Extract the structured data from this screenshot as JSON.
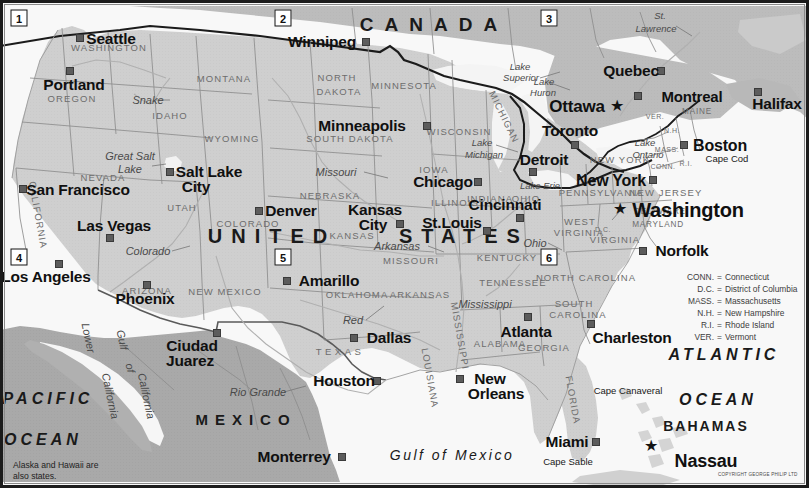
{
  "map": {
    "title": "United States reference map",
    "colors": {
      "us_land": "#cfcfcf",
      "canada_land": "#bcbcbc",
      "mexico_land": "#a9a9a9",
      "water": "#f7f7f7",
      "lake": "#f2f2f2",
      "border_line": "#1d1d1d",
      "state_line": "#8d8d8d",
      "river": "#b6b6b6",
      "frame": "#1b1b1b",
      "city_marker": "#5c5c5c",
      "text_dark": "#101010",
      "text_state": "#6d6d6d"
    },
    "note": "Alaska and Hawaii are\nalso states.",
    "note_line1": "Alaska and Hawaii are",
    "note_line2": "also states.",
    "copyright": "COPYRIGHT GEORGE PHILIP LTD"
  },
  "countries": [
    {
      "name": "CANADA",
      "x": 434,
      "y": 24
    },
    {
      "name": "UNITED  STATES",
      "x": 372,
      "y": 236
    },
    {
      "name": "MEXICO",
      "x": 246,
      "y": 419
    }
  ],
  "country_parts": [
    {
      "name": "UNITED",
      "x": 272,
      "y": 236
    },
    {
      "name": "STATES",
      "x": 464,
      "y": 236
    }
  ],
  "cities": [
    {
      "name": "Seattle",
      "label_x": 111,
      "label_y": 39,
      "dot_x": 80,
      "dot_y": 38,
      "size": "big",
      "capital": false
    },
    {
      "name": "Portland",
      "label_x": 74,
      "label_y": 84,
      "dot_x": 70,
      "dot_y": 71,
      "size": "big",
      "capital": false
    },
    {
      "name": "San Francisco",
      "label_x": 76,
      "label_y": 190,
      "dot_x": 23,
      "dot_y": 189,
      "size": "big",
      "capital": false
    },
    {
      "name": "Los Angeles",
      "label_x": 46,
      "label_y": 277,
      "dot_x": 59,
      "dot_y": 264,
      "size": "big",
      "capital": false
    },
    {
      "name": "Las Vegas",
      "label_x": 114,
      "label_y": 226,
      "dot_x": 110,
      "dot_y": 238,
      "size": "big",
      "capital": false
    },
    {
      "name": "Salt Lake",
      "label_x": 209,
      "label_y": 172,
      "dot_x": 170,
      "dot_y": 172,
      "size": "big",
      "capital": false
    },
    {
      "name": "City",
      "label_x": 196,
      "label_y": 186,
      "dot_x": null,
      "dot_y": null,
      "size": "big",
      "capital": false
    },
    {
      "name": "Phoenix",
      "label_x": 145,
      "label_y": 298,
      "dot_x": 147,
      "dot_y": 285,
      "size": "big",
      "capital": false
    },
    {
      "name": "Denver",
      "label_x": 291,
      "label_y": 211,
      "dot_x": 259,
      "dot_y": 211,
      "size": "big",
      "capital": false
    },
    {
      "name": "Amarillo",
      "label_x": 329,
      "label_y": 281,
      "dot_x": 287,
      "dot_y": 281,
      "size": "big",
      "capital": false
    },
    {
      "name": "Ciudad",
      "label_x": 192,
      "label_y": 345,
      "dot_x": 217,
      "dot_y": 333,
      "size": "big",
      "capital": false
    },
    {
      "name": "Juarez",
      "label_x": 190,
      "label_y": 360,
      "dot_x": null,
      "dot_y": null,
      "size": "big",
      "capital": false
    },
    {
      "name": "Dallas",
      "label_x": 389,
      "label_y": 337,
      "dot_x": 354,
      "dot_y": 338,
      "size": "big",
      "capital": false
    },
    {
      "name": "Houston",
      "label_x": 345,
      "label_y": 381,
      "dot_x": 377,
      "dot_y": 381,
      "size": "big",
      "capital": false
    },
    {
      "name": "Monterrey",
      "label_x": 293,
      "label_y": 457,
      "dot_x": 342,
      "dot_y": 457,
      "size": "big",
      "capital": false
    },
    {
      "name": "Winnipeg",
      "label_x": 322,
      "label_y": 42,
      "dot_x": 366,
      "dot_y": 42,
      "size": "big",
      "capital": false
    },
    {
      "name": "Minneapolis",
      "label_x": 362,
      "label_y": 125,
      "dot_x": 427,
      "dot_y": 126,
      "size": "big",
      "capital": false
    },
    {
      "name": "Kansas",
      "label_x": 375,
      "label_y": 210,
      "dot_x": null,
      "dot_y": null,
      "size": "big",
      "capital": false
    },
    {
      "name": "City",
      "label_x": 373,
      "label_y": 224,
      "dot_x": 400,
      "dot_y": 224,
      "size": "big",
      "capital": false
    },
    {
      "name": "Chicago",
      "label_x": 443,
      "label_y": 182,
      "dot_x": 478,
      "dot_y": 182,
      "size": "big",
      "capital": false
    },
    {
      "name": "St.Louis",
      "label_x": 452,
      "label_y": 223,
      "dot_x": 487,
      "dot_y": 231,
      "size": "big",
      "capital": false
    },
    {
      "name": "Detroit",
      "label_x": 544,
      "label_y": 160,
      "dot_x": 533,
      "dot_y": 172,
      "size": "big",
      "capital": false
    },
    {
      "name": "Cincinnati",
      "label_x": 505,
      "label_y": 205,
      "dot_x": 520,
      "dot_y": 218,
      "size": "big",
      "capital": false
    },
    {
      "name": "New Orleans",
      "label_x": 491,
      "label_y": 379,
      "dot_x": 460,
      "dot_y": 379,
      "size": "big",
      "capital": false
    },
    {
      "name": "New",
      "label_x": 488,
      "label_y": 379,
      "dot_x": null,
      "dot_y": null,
      "size": "big",
      "capital": false
    },
    {
      "name": "Orleans",
      "label_x": 495,
      "label_y": 393,
      "dot_x": null,
      "dot_y": null,
      "size": "big",
      "capital": false
    },
    {
      "name": "Atlanta",
      "label_x": 526,
      "label_y": 331,
      "dot_x": 528,
      "dot_y": 317,
      "size": "big",
      "capital": false
    },
    {
      "name": "Charleston",
      "label_x": 630,
      "label_y": 337,
      "dot_x": 591,
      "dot_y": 324,
      "size": "big",
      "capital": false
    },
    {
      "name": "Miami",
      "label_x": 566,
      "label_y": 441,
      "dot_x": 596,
      "dot_y": 442,
      "size": "big",
      "capital": false
    },
    {
      "name": "Norfolk",
      "label_x": 680,
      "label_y": 251,
      "dot_x": 643,
      "dot_y": 251,
      "size": "big",
      "capital": false
    },
    {
      "name": "Washington",
      "label_x": 684,
      "label_y": 210,
      "dot_x": null,
      "dot_y": null,
      "size": "cap",
      "capital": true,
      "star_x": 620,
      "star_y": 209
    },
    {
      "name": "New York",
      "label_x": 611,
      "label_y": 181,
      "dot_x": 653,
      "dot_y": 180,
      "size": "big",
      "capital": false
    },
    {
      "name": "Boston",
      "label_x": 718,
      "label_y": 146,
      "dot_x": 684,
      "dot_y": 145,
      "size": "big",
      "capital": false
    },
    {
      "name": "Toronto",
      "label_x": 570,
      "label_y": 131,
      "dot_x": 575,
      "dot_y": 145,
      "size": "big",
      "capital": false
    },
    {
      "name": "Ottawa",
      "label_x": 577,
      "label_y": 106,
      "dot_x": null,
      "dot_y": null,
      "size": "cap",
      "capital": true,
      "star_x": 617,
      "star_y": 106
    },
    {
      "name": "Montreal",
      "label_x": 692,
      "label_y": 95,
      "dot_x": 638,
      "dot_y": 96,
      "size": "big",
      "capital": false
    },
    {
      "name": "Quebec",
      "label_x": 631,
      "label_y": 71,
      "dot_x": 661,
      "dot_y": 71,
      "size": "big",
      "capital": false
    },
    {
      "name": "Halifax",
      "label_x": 777,
      "label_y": 104,
      "dot_x": 758,
      "dot_y": 92,
      "size": "big",
      "capital": false
    },
    {
      "name": "Nassau",
      "label_x": 704,
      "label_y": 460,
      "dot_x": null,
      "dot_y": null,
      "size": "cap",
      "capital": true,
      "star_x": 651,
      "star_y": 446
    }
  ],
  "states": [
    {
      "name": "WASHINGTON",
      "x": 109,
      "y": 48,
      "cls": "state"
    },
    {
      "name": "OREGON",
      "x": 72,
      "y": 99,
      "cls": "state"
    },
    {
      "name": "CALIFORNIA",
      "x": 38,
      "y": 215,
      "cls": "state rot",
      "rot": 80
    },
    {
      "name": "NEVADA",
      "x": 103,
      "y": 178,
      "cls": "state"
    },
    {
      "name": "IDAHO",
      "x": 170,
      "y": 116,
      "cls": "state"
    },
    {
      "name": "MONTANA",
      "x": 224,
      "y": 79,
      "cls": "state"
    },
    {
      "name": "WYOMING",
      "x": 232,
      "y": 139,
      "cls": "state"
    },
    {
      "name": "UTAH",
      "x": 182,
      "y": 208,
      "cls": "state"
    },
    {
      "name": "ARIZONA",
      "x": 147,
      "y": 281,
      "cls": "state"
    },
    {
      "name": "NEW MEXICO",
      "x": 225,
      "y": 292,
      "cls": "state"
    },
    {
      "name": "COLORADO",
      "x": 248,
      "y": 224,
      "cls": "state"
    },
    {
      "name": "NORTH",
      "x": 337,
      "y": 78,
      "cls": "state"
    },
    {
      "name": "DAKOTA",
      "x": 339,
      "y": 92,
      "cls": "state"
    },
    {
      "name": "SOUTH DAKOTA",
      "x": 350,
      "y": 139,
      "cls": "state"
    },
    {
      "name": "NEBRASKA",
      "x": 330,
      "y": 196,
      "cls": "state"
    },
    {
      "name": "KANSAS",
      "x": 352,
      "y": 236,
      "cls": "state"
    },
    {
      "name": "OKLAHOMA",
      "x": 357,
      "y": 295,
      "cls": "state"
    },
    {
      "name": "TEXAS",
      "x": 340,
      "y": 352,
      "cls": "state"
    },
    {
      "name": "MINNESOTA",
      "x": 404,
      "y": 86,
      "cls": "state"
    },
    {
      "name": "IOWA",
      "x": 434,
      "y": 170,
      "cls": "state"
    },
    {
      "name": "MISSOURI",
      "x": 411,
      "y": 261,
      "cls": "state"
    },
    {
      "name": "ARKANSAS",
      "x": 420,
      "y": 295,
      "cls": "state"
    },
    {
      "name": "LOUISIANA",
      "x": 430,
      "y": 378,
      "cls": "state rot",
      "rot": 80
    },
    {
      "name": "WISCONSIN",
      "x": 459,
      "y": 132,
      "cls": "state"
    },
    {
      "name": "ILLINOIS",
      "x": 455,
      "y": 203,
      "cls": "state"
    },
    {
      "name": "INDIANA",
      "x": 490,
      "y": 199,
      "cls": "state"
    },
    {
      "name": "MICHIGAN",
      "x": 504,
      "y": 117,
      "cls": "state rot",
      "rot": 64
    },
    {
      "name": "OHIO",
      "x": 526,
      "y": 199,
      "cls": "state"
    },
    {
      "name": "KENTUCKY",
      "x": 507,
      "y": 258,
      "cls": "state"
    },
    {
      "name": "TENNESSEE",
      "x": 513,
      "y": 283,
      "cls": "state"
    },
    {
      "name": "MISSISSIPPI",
      "x": 460,
      "y": 336,
      "cls": "state rot",
      "rot": 80
    },
    {
      "name": "ALABAMA",
      "x": 500,
      "y": 344,
      "cls": "state"
    },
    {
      "name": "GEORGIA",
      "x": 544,
      "y": 348,
      "cls": "state"
    },
    {
      "name": "FLORIDA",
      "x": 573,
      "y": 400,
      "cls": "state rot",
      "rot": 80
    },
    {
      "name": "WEST",
      "x": 580,
      "y": 222,
      "cls": "state"
    },
    {
      "name": "VIRGINIA",
      "x": 579,
      "y": 232,
      "cls": "state"
    },
    {
      "name": "VIRGINIA",
      "x": 615,
      "y": 240,
      "cls": "state"
    },
    {
      "name": "NORTH CAROLINA",
      "x": 586,
      "y": 278,
      "cls": "state"
    },
    {
      "name": "SOUTH",
      "x": 574,
      "y": 304,
      "cls": "state"
    },
    {
      "name": "CAROLINA",
      "x": 578,
      "y": 315,
      "cls": "state"
    },
    {
      "name": "PENNSYLVANIA",
      "x": 601,
      "y": 193,
      "cls": "state"
    },
    {
      "name": "NEW JERSEY",
      "x": 666,
      "y": 193,
      "cls": "state"
    },
    {
      "name": "NEW YORK",
      "x": 620,
      "y": 160,
      "cls": "state"
    },
    {
      "name": "MARYLAND",
      "x": 658,
      "y": 224,
      "cls": "state sm"
    },
    {
      "name": "DELAWARE",
      "x": 660,
      "y": 212,
      "cls": "state sm"
    },
    {
      "name": "MAINE",
      "x": 697,
      "y": 112,
      "cls": "state sm"
    },
    {
      "name": "MAINE",
      "x": 697,
      "y": 112,
      "cls": "state sm"
    }
  ],
  "state_abbrev_on_map": [
    {
      "name": "VER.",
      "x": 655,
      "y": 116
    },
    {
      "name": "N.H.",
      "x": 672,
      "y": 130
    },
    {
      "name": "MASS.",
      "x": 667,
      "y": 149
    },
    {
      "name": "CONN.",
      "x": 663,
      "y": 163
    },
    {
      "name": "R.I.",
      "x": 684,
      "y": 161
    },
    {
      "name": "D.C.",
      "x": 603,
      "y": 229
    }
  ],
  "water_labels": [
    {
      "name": "Snake",
      "x": 148,
      "y": 100,
      "cls": "water"
    },
    {
      "name": "Great Salt",
      "x": 130,
      "y": 156,
      "cls": "water"
    },
    {
      "name": "Lake",
      "x": 126,
      "y": 170,
      "cls": "water"
    },
    {
      "name": "Colorado",
      "x": 148,
      "y": 251,
      "cls": "water"
    },
    {
      "name": "Missouri",
      "x": 336,
      "y": 172,
      "cls": "water"
    },
    {
      "name": "Arkansas",
      "x": 397,
      "y": 246,
      "cls": "water"
    },
    {
      "name": "Red",
      "x": 353,
      "y": 320,
      "cls": "water"
    },
    {
      "name": "Rio Grande",
      "x": 258,
      "y": 392,
      "cls": "water"
    },
    {
      "name": "Mississippi",
      "x": 485,
      "y": 304,
      "cls": "water"
    },
    {
      "name": "Ohio",
      "x": 535,
      "y": 243,
      "cls": "water"
    },
    {
      "name": "Lake",
      "x": 520,
      "y": 67,
      "cls": "water sm"
    },
    {
      "name": "Superior",
      "x": 521,
      "y": 77,
      "cls": "water sm"
    },
    {
      "name": "Lake",
      "x": 544,
      "y": 82,
      "cls": "water sm"
    },
    {
      "name": "Huron",
      "x": 543,
      "y": 93,
      "cls": "water sm"
    },
    {
      "name": "Lake",
      "x": 482,
      "y": 143,
      "cls": "water sm"
    },
    {
      "name": "Michigan",
      "x": 484,
      "y": 154,
      "cls": "water sm"
    },
    {
      "name": "Lake Erie",
      "x": 540,
      "y": 186,
      "cls": "water sm"
    },
    {
      "name": "Lake",
      "x": 645,
      "y": 143,
      "cls": "water sm"
    },
    {
      "name": "Ontario",
      "x": 648,
      "y": 155,
      "cls": "water sm"
    },
    {
      "name": "St.",
      "x": 660,
      "y": 16,
      "cls": "water sm"
    },
    {
      "name": "Lawrence",
      "x": 656,
      "y": 28,
      "cls": "water sm"
    },
    {
      "name": "Lower",
      "x": 88,
      "y": 338,
      "cls": "water rot",
      "rot": 78
    },
    {
      "name": "California",
      "x": 112,
      "y": 392,
      "cls": "water rot",
      "rot": 78
    },
    {
      "name": "Gulf",
      "x": 111,
      "y": 340,
      "cls": "water rot",
      "rot": 78
    },
    {
      "name": "of",
      "x": 120,
      "y": 368,
      "cls": "water rot",
      "rot": 78
    },
    {
      "name": "California",
      "x": 144,
      "y": 392,
      "cls": "water rot",
      "rot": 78
    }
  ],
  "oceans": [
    {
      "name": "PACIFIC",
      "x": 48,
      "y": 399,
      "cls": "ocean"
    },
    {
      "name": "OCEAN",
      "x": 43,
      "y": 440,
      "cls": "ocean"
    },
    {
      "name": "ATLANTIC",
      "x": 724,
      "y": 355,
      "cls": "ocean"
    },
    {
      "name": "OCEAN",
      "x": 718,
      "y": 400,
      "cls": "ocean"
    },
    {
      "name": "Gulf of Mexico",
      "x": 452,
      "y": 455,
      "cls": "ocean gulf"
    }
  ],
  "capes": [
    {
      "name": "Cape Cod",
      "x": 727,
      "y": 159
    },
    {
      "name": "Cape Canaveral",
      "x": 628,
      "y": 391
    },
    {
      "name": "Cape Sable",
      "x": 568,
      "y": 462
    }
  ],
  "islands": [
    {
      "name": "BAHAMAS",
      "x": 706,
      "y": 426
    }
  ],
  "number_boxes": [
    {
      "label": "1",
      "x": 19,
      "y": 18
    },
    {
      "label": "2",
      "x": 283,
      "y": 18
    },
    {
      "label": "3",
      "x": 549,
      "y": 18
    },
    {
      "label": "4",
      "x": 19,
      "y": 257
    },
    {
      "label": "5",
      "x": 283,
      "y": 257
    },
    {
      "label": "6",
      "x": 549,
      "y": 257
    }
  ],
  "legend": {
    "x": 686,
    "y": 272,
    "rows": [
      {
        "abbr": "CONN.",
        "eq": "=",
        "full": "Connecticut"
      },
      {
        "abbr": "D.C.",
        "eq": "=",
        "full": "District of Columbia"
      },
      {
        "abbr": "MASS.",
        "eq": "=",
        "full": "Massachusetts"
      },
      {
        "abbr": "N.H.",
        "eq": "=",
        "full": "New Hampshire"
      },
      {
        "abbr": "R.I.",
        "eq": "=",
        "full": "Rhode Island"
      },
      {
        "abbr": "VER.",
        "eq": "=",
        "full": "Vermont"
      }
    ]
  }
}
